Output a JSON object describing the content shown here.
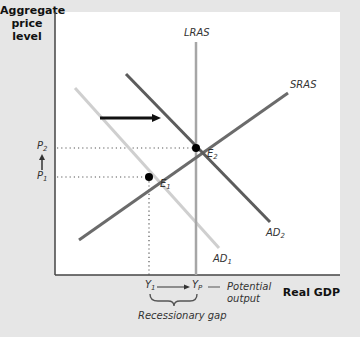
{
  "diagram": {
    "title": "",
    "y_axis_label": "Aggregate price level",
    "y_axis_label_lines": [
      "Aggregate",
      "price",
      "level"
    ],
    "x_axis_label": "Real GDP",
    "curves": {
      "lras": {
        "label": "LRAS",
        "color": "#a6a6a6"
      },
      "sras": {
        "label": "SRAS",
        "color": "#6b6b6b"
      },
      "ad1": {
        "label": "AD",
        "sub": "1",
        "color": "#cfcfcf"
      },
      "ad2": {
        "label": "AD",
        "sub": "2",
        "color": "#5c5c5c"
      }
    },
    "points": {
      "e1": {
        "label": "E",
        "sub": "1"
      },
      "e2": {
        "label": "E",
        "sub": "2"
      }
    },
    "price_levels": {
      "p1": {
        "label": "P",
        "sub": "1"
      },
      "p2": {
        "label": "P",
        "sub": "2"
      }
    },
    "outputs": {
      "y1": {
        "label": "Y",
        "sub": "1"
      },
      "yp": {
        "label": "Y",
        "sub": "P"
      }
    },
    "annotations": {
      "potential_output_line1": "Potential",
      "potential_output_line2": "output",
      "recessionary_gap": "Recessionary gap"
    },
    "shift_arrow": "AD shifts right"
  }
}
